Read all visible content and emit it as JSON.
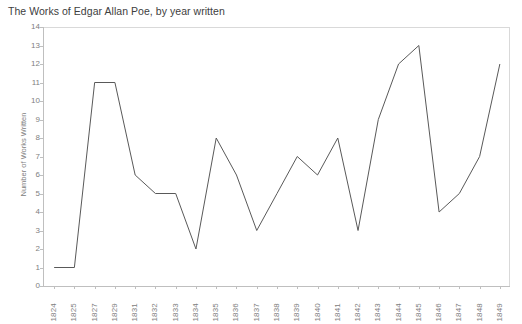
{
  "chart_data": {
    "type": "line",
    "title": "The Works of Edgar Allan Poe, by year written",
    "xlabel": "",
    "ylabel": "Number of Works Written",
    "categories": [
      "1824",
      "1825",
      "1827",
      "1829",
      "1831",
      "1832",
      "1833",
      "1834",
      "1835",
      "1836",
      "1837",
      "1838",
      "1839",
      "1840",
      "1841",
      "1842",
      "1843",
      "1844",
      "1845",
      "1846",
      "1847",
      "1848",
      "1849"
    ],
    "values": [
      1,
      1,
      11,
      11,
      6,
      5,
      5,
      2,
      8,
      6,
      3,
      5,
      7,
      6,
      8,
      3,
      9,
      12,
      13,
      4,
      5,
      7,
      12
    ],
    "series": [
      {
        "name": "Number of Works Written",
        "values": [
          1,
          1,
          11,
          11,
          6,
          5,
          5,
          2,
          8,
          6,
          3,
          5,
          7,
          6,
          8,
          3,
          9,
          12,
          13,
          4,
          5,
          7,
          12
        ]
      }
    ],
    "ylim": [
      0,
      14
    ],
    "y_ticks": [
      0,
      1,
      2,
      3,
      4,
      5,
      6,
      7,
      8,
      9,
      10,
      11,
      12,
      13,
      14
    ],
    "grid": false,
    "legend": "none",
    "line_color": "#595959",
    "axis_color": "#bfbfbf",
    "text_color": "#808080",
    "title_color": "#404040",
    "background": "#ffffff"
  }
}
